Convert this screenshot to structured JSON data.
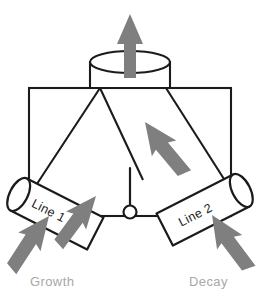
{
  "diagram": {
    "colors": {
      "arrow_gray": "#7f7f7f",
      "outline_black": "#1b1b1b",
      "caption_gray": "#a8a8a8",
      "background": "#ffffff"
    },
    "pipes": [
      {
        "id": "line-1",
        "label": "Line 1",
        "side": "left",
        "rotation_deg": 27
      },
      {
        "id": "line-2",
        "label": "Line 2",
        "side": "right",
        "rotation_deg": -27
      }
    ],
    "captions": [
      {
        "id": "growth",
        "label": "Growth",
        "side": "left"
      },
      {
        "id": "decay",
        "label": "Decay",
        "side": "right"
      }
    ],
    "flow_arrows": [
      {
        "id": "outlet-arrow",
        "direction": "up",
        "position": "top-center"
      },
      {
        "id": "interior-arrow-left",
        "direction": "up-right",
        "position": "center-left"
      },
      {
        "id": "interior-arrow-right",
        "direction": "up-left",
        "position": "center-right"
      },
      {
        "id": "growth-inlet-arrow",
        "direction": "up-right",
        "position": "bottom-left"
      },
      {
        "id": "decay-inlet-arrow",
        "direction": "up-left",
        "position": "bottom-right"
      }
    ],
    "parts": [
      {
        "id": "outlet-cylinder",
        "name": "Outlet cylinder"
      },
      {
        "id": "vessel-body",
        "name": "Vessel body"
      },
      {
        "id": "hopper-funnel",
        "name": "Hopper funnel"
      },
      {
        "id": "level-probe",
        "name": "Level probe"
      }
    ]
  }
}
